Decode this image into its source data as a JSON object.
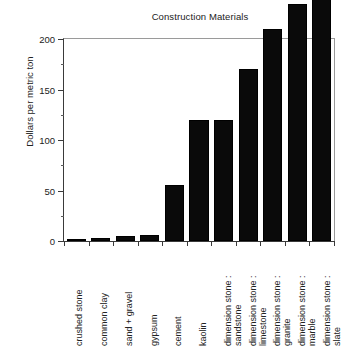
{
  "chart_data": {
    "type": "bar",
    "title": "Construction Materials",
    "xlabel": "",
    "ylabel": "Dollars per metric ton",
    "ylim": [
      0,
      200
    ],
    "yticks": [
      0,
      50,
      100,
      150,
      200
    ],
    "ytick_labels": [
      "0",
      "50",
      "100",
      "150",
      "200"
    ],
    "minor_tick_interval": 25,
    "grid": false,
    "legend": "none",
    "orientation": "vertical",
    "bar_color": "#0a0a0a",
    "categories": [
      "crushed stone",
      "common clay",
      "sand + gravel",
      "gypsum",
      "cement",
      "kaolin",
      "dimension stone : sandstone",
      "dimension stone : limestone",
      "dimension stone : granite",
      "dimension stone : marble",
      "dimension stone : slate"
    ],
    "category_lines": [
      [
        "crushed stone",
        ""
      ],
      [
        "common clay",
        ""
      ],
      [
        "sand + gravel",
        ""
      ],
      [
        "gypsum",
        ""
      ],
      [
        "cement",
        ""
      ],
      [
        "kaolin",
        ""
      ],
      [
        "dimension stone :",
        "sandstone"
      ],
      [
        "dimension stone :",
        "limestone"
      ],
      [
        "dimension stone :",
        "granite"
      ],
      [
        "dimension stone :",
        "marble"
      ],
      [
        "dimension stone :",
        "slate"
      ]
    ],
    "values": [
      2,
      3,
      5,
      6,
      55,
      120,
      120,
      170,
      210,
      235,
      260
    ]
  }
}
